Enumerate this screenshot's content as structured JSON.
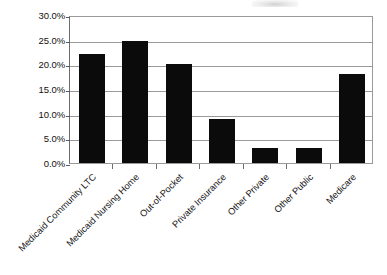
{
  "chart_data": {
    "type": "bar",
    "title": "",
    "subtitle": "",
    "xlabel": "",
    "ylabel": "",
    "categories": [
      "Medicaid Community LTC",
      "Medicaid Nursing Home",
      "Out-of-Pocket",
      "Private Insurance",
      "Other Private",
      "Other Public",
      "Medicare"
    ],
    "values": [
      22.0,
      24.8,
      20.0,
      9.0,
      3.0,
      3.0,
      18.0
    ],
    "value_format": "percent",
    "ylim": [
      0,
      30
    ],
    "ytick_values": [
      0,
      5,
      10,
      15,
      20,
      25,
      30
    ],
    "ytick_labels": [
      "0.0%",
      "5.0%",
      "10.0%",
      "15.0%",
      "20.0%",
      "25.0%",
      "30.0%"
    ],
    "grid": "horizontal",
    "legend": "none",
    "bar_color": "#0b0b0b",
    "grid_color": "#9a9a9a",
    "axis_color": "#6e6e6e",
    "background_color": "#ffffff",
    "xtick_label_rotation": -45
  }
}
